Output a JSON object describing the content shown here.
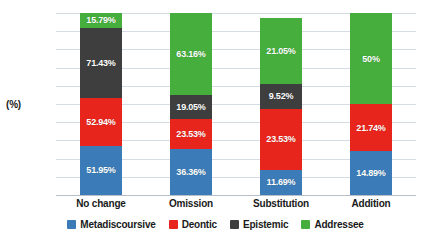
{
  "chart_data": {
    "type": "bar",
    "subtype": "stacked-bar-100",
    "title": "",
    "xlabel": "",
    "ylabel": "(%)",
    "ylim": [
      0,
      100
    ],
    "yticks": [
      0,
      10,
      20,
      30,
      40,
      50,
      60,
      70,
      80,
      90,
      100
    ],
    "grid": true,
    "legend_position": "bottom",
    "categories": [
      "No change",
      "Omission",
      "Substitution",
      "Addition"
    ],
    "series": [
      {
        "name": "Metadiscoursive",
        "color": "#3B7CB8",
        "values": [
          51.95,
          36.36,
          11.69,
          14.89
        ],
        "labels": [
          "51.95%",
          "36.36%",
          "11.69%",
          "14.89%"
        ],
        "stack_heights": [
          27.0,
          25.5,
          14.0,
          24.0
        ]
      },
      {
        "name": "Deontic",
        "color": "#E8251C",
        "values": [
          52.94,
          23.53,
          23.53,
          21.74
        ],
        "labels": [
          "52.94%",
          "23.53%",
          "23.53%",
          "21.74%"
        ],
        "stack_heights": [
          26.5,
          16.5,
          33.5,
          26.0
        ]
      },
      {
        "name": "Epistemic",
        "color": "#3E3E3E",
        "values": [
          71.43,
          19.05,
          9.52,
          0
        ],
        "labels": [
          "71.43%",
          "19.05%",
          "9.52%",
          ""
        ],
        "stack_heights": [
          38.5,
          13.0,
          13.5,
          0
        ]
      },
      {
        "name": "Addressee",
        "color": "#45AE3D",
        "values": [
          15.79,
          63.16,
          21.05,
          50
        ],
        "labels": [
          "15.79%",
          "63.16%",
          "21.05%",
          "50%"
        ],
        "stack_heights": [
          8.0,
          45.0,
          36.5,
          50.0
        ]
      }
    ]
  },
  "axis": {
    "unit_label": "(%)"
  }
}
